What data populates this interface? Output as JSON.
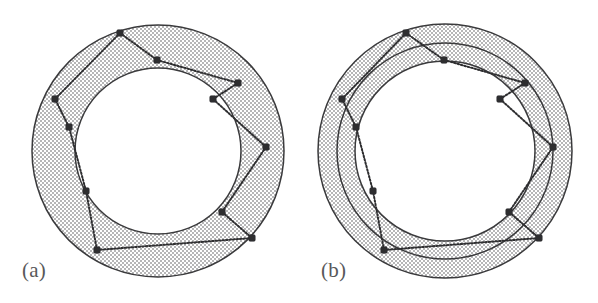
{
  "figure": {
    "kind": "two-panel-diagram",
    "background_color": "#ffffff",
    "width": 598,
    "height": 303,
    "stroke_color": "#3a3a3c",
    "stipple_dot_color": "#4a4a4c",
    "node_color": "#2e2e30",
    "caption_color": "#58585a"
  },
  "panels": [
    {
      "id": "a",
      "caption": "(a)",
      "center": {
        "x": 158,
        "y": 151
      },
      "rings": [
        {
          "name": "outer-boundary-circle",
          "radius": 126
        },
        {
          "name": "inner-boundary-circle",
          "radius": 83
        }
      ],
      "bands": [
        {
          "name": "annulus-band",
          "outer_radius": 126,
          "inner_radius": 83,
          "fill": "stipple"
        }
      ],
      "nodes": [
        {
          "id": "n0",
          "x": 120,
          "y": 33,
          "ring": "outer"
        },
        {
          "id": "n1",
          "x": 157,
          "y": 60,
          "ring": "inner"
        },
        {
          "id": "n2",
          "x": 238,
          "y": 83,
          "ring": "outer"
        },
        {
          "id": "n3",
          "x": 213,
          "y": 99,
          "ring": "inner"
        },
        {
          "id": "n4",
          "x": 266,
          "y": 147,
          "ring": "outer"
        },
        {
          "id": "n5",
          "x": 222,
          "y": 212,
          "ring": "inner"
        },
        {
          "id": "n6",
          "x": 252,
          "y": 238,
          "ring": "outer"
        },
        {
          "id": "n7",
          "x": 97,
          "y": 250,
          "ring": "outer"
        },
        {
          "id": "n8",
          "x": 86,
          "y": 191,
          "ring": "inner"
        },
        {
          "id": "n9",
          "x": 69,
          "y": 127,
          "ring": "inner"
        },
        {
          "id": "n10",
          "x": 55,
          "y": 99,
          "ring": "outer"
        }
      ],
      "edges": [
        [
          "n0",
          "n1"
        ],
        [
          "n1",
          "n2"
        ],
        [
          "n2",
          "n3"
        ],
        [
          "n3",
          "n4"
        ],
        [
          "n4",
          "n5"
        ],
        [
          "n5",
          "n6"
        ],
        [
          "n6",
          "n7"
        ],
        [
          "n7",
          "n8"
        ],
        [
          "n8",
          "n9"
        ],
        [
          "n9",
          "n10"
        ],
        [
          "n10",
          "n0"
        ]
      ]
    },
    {
      "id": "b",
      "caption": "(b)",
      "center": {
        "x": 146,
        "y": 151
      },
      "rings": [
        {
          "name": "outer-boundary-circle",
          "radius": 127
        },
        {
          "name": "middle-boundary-circle",
          "radius": 108
        },
        {
          "name": "inner-boundary-circle",
          "radius": 90
        }
      ],
      "bands": [
        {
          "name": "outer-annulus-band",
          "outer_radius": 127,
          "inner_radius": 108,
          "fill": "stipple"
        },
        {
          "name": "inner-annulus-band",
          "outer_radius": 108,
          "inner_radius": 90,
          "fill": "stipple"
        }
      ],
      "nodes": [
        {
          "id": "n0",
          "x": 107,
          "y": 33,
          "ring": "outer"
        },
        {
          "id": "n1",
          "x": 145,
          "y": 60,
          "ring": "middle"
        },
        {
          "id": "n2",
          "x": 226,
          "y": 83,
          "ring": "outer"
        },
        {
          "id": "n3",
          "x": 201,
          "y": 99,
          "ring": "middle"
        },
        {
          "id": "n4",
          "x": 254,
          "y": 147,
          "ring": "outer"
        },
        {
          "id": "n5",
          "x": 210,
          "y": 212,
          "ring": "middle"
        },
        {
          "id": "n6",
          "x": 240,
          "y": 238,
          "ring": "outer"
        },
        {
          "id": "n7",
          "x": 85,
          "y": 250,
          "ring": "outer"
        },
        {
          "id": "n8",
          "x": 74,
          "y": 191,
          "ring": "middle"
        },
        {
          "id": "n9",
          "x": 57,
          "y": 127,
          "ring": "middle"
        },
        {
          "id": "n10",
          "x": 43,
          "y": 99,
          "ring": "outer"
        }
      ],
      "edges": [
        [
          "n0",
          "n1"
        ],
        [
          "n1",
          "n2"
        ],
        [
          "n2",
          "n3"
        ],
        [
          "n3",
          "n4"
        ],
        [
          "n4",
          "n5"
        ],
        [
          "n5",
          "n6"
        ],
        [
          "n6",
          "n7"
        ],
        [
          "n7",
          "n8"
        ],
        [
          "n8",
          "n9"
        ],
        [
          "n9",
          "n10"
        ],
        [
          "n10",
          "n0"
        ]
      ]
    }
  ]
}
